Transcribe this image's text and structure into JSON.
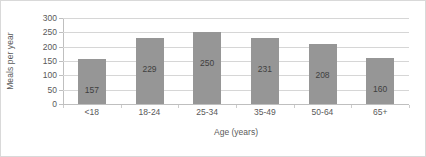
{
  "chart_data": {
    "type": "bar",
    "title": "",
    "subtitle": "",
    "xlabel": "Age (years)",
    "ylabel": "Meals per year",
    "categories": [
      "<18",
      "18-24",
      "25-34",
      "35-49",
      "50-64",
      "65+"
    ],
    "values": [
      157,
      229,
      250,
      231,
      208,
      160
    ],
    "series": [
      {
        "name": "Meals per year",
        "values": [
          157,
          229,
          250,
          231,
          208,
          160
        ]
      }
    ],
    "data_labels": [
      "157",
      "229",
      "250",
      "231",
      "208",
      "160"
    ],
    "ylim": [
      0,
      300
    ],
    "ytick_values": [
      0,
      50,
      100,
      150,
      200,
      250,
      300
    ],
    "ytick_labels": [
      "0",
      "50",
      "100",
      "150",
      "200",
      "250",
      "300"
    ],
    "grid": {
      "horizontal": true,
      "vertical": false
    },
    "legend": {
      "visible": false,
      "position": "none"
    },
    "colors": {
      "bar_fill": "#969696",
      "gridline": "#d6d6d6",
      "axis_line": "#bfbfbf",
      "tick_text": "#595959",
      "label_text": "#3f3f3f",
      "plot_background": "#ffffff",
      "frame_border": "#d9d9d9"
    }
  }
}
